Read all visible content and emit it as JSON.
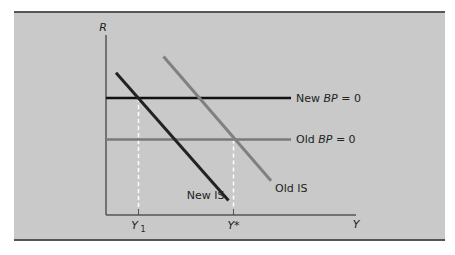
{
  "chart_data": {
    "type": "line",
    "title": "",
    "xlabel": "Y",
    "ylabel": "R",
    "xlim": [
      0,
      10
    ],
    "ylim": [
      0,
      10
    ],
    "grid": false,
    "series": [
      {
        "name": "New BP = 0",
        "label_prefix": "New ",
        "label_italic": "BP",
        "label_suffix": " = 0",
        "color": "#111111",
        "points": [
          [
            0,
            6.5
          ],
          [
            7.4,
            6.5
          ]
        ]
      },
      {
        "name": "Old BP = 0",
        "label_prefix": "Old ",
        "label_italic": "BP",
        "label_suffix": " = 0",
        "color": "#7a7a7a",
        "points": [
          [
            0,
            4.2
          ],
          [
            7.4,
            4.2
          ]
        ]
      },
      {
        "name": "New IS",
        "label": "New IS",
        "color": "#222222",
        "points": [
          [
            0.4,
            7.9
          ],
          [
            4.9,
            0.8
          ]
        ]
      },
      {
        "name": "Old IS",
        "label": "Old IS",
        "color": "#808080",
        "points": [
          [
            2.3,
            8.8
          ],
          [
            6.6,
            1.9
          ]
        ]
      }
    ],
    "guides": [
      {
        "name": "Y1",
        "x": 1.3,
        "y_top": 6.5,
        "label_main": "Y",
        "label_sub": "1"
      },
      {
        "name": "Y*",
        "x": 5.1,
        "y_top": 4.2,
        "label_main": "Y*",
        "label_sub": ""
      }
    ],
    "tick_labels": {
      "y1": "Y",
      "y1_sub": "1",
      "ystar": "Y*"
    }
  },
  "colors": {
    "panel": "#c9c9c9",
    "border": "#555555",
    "axis": "#555555",
    "guide": "#ffffff"
  }
}
